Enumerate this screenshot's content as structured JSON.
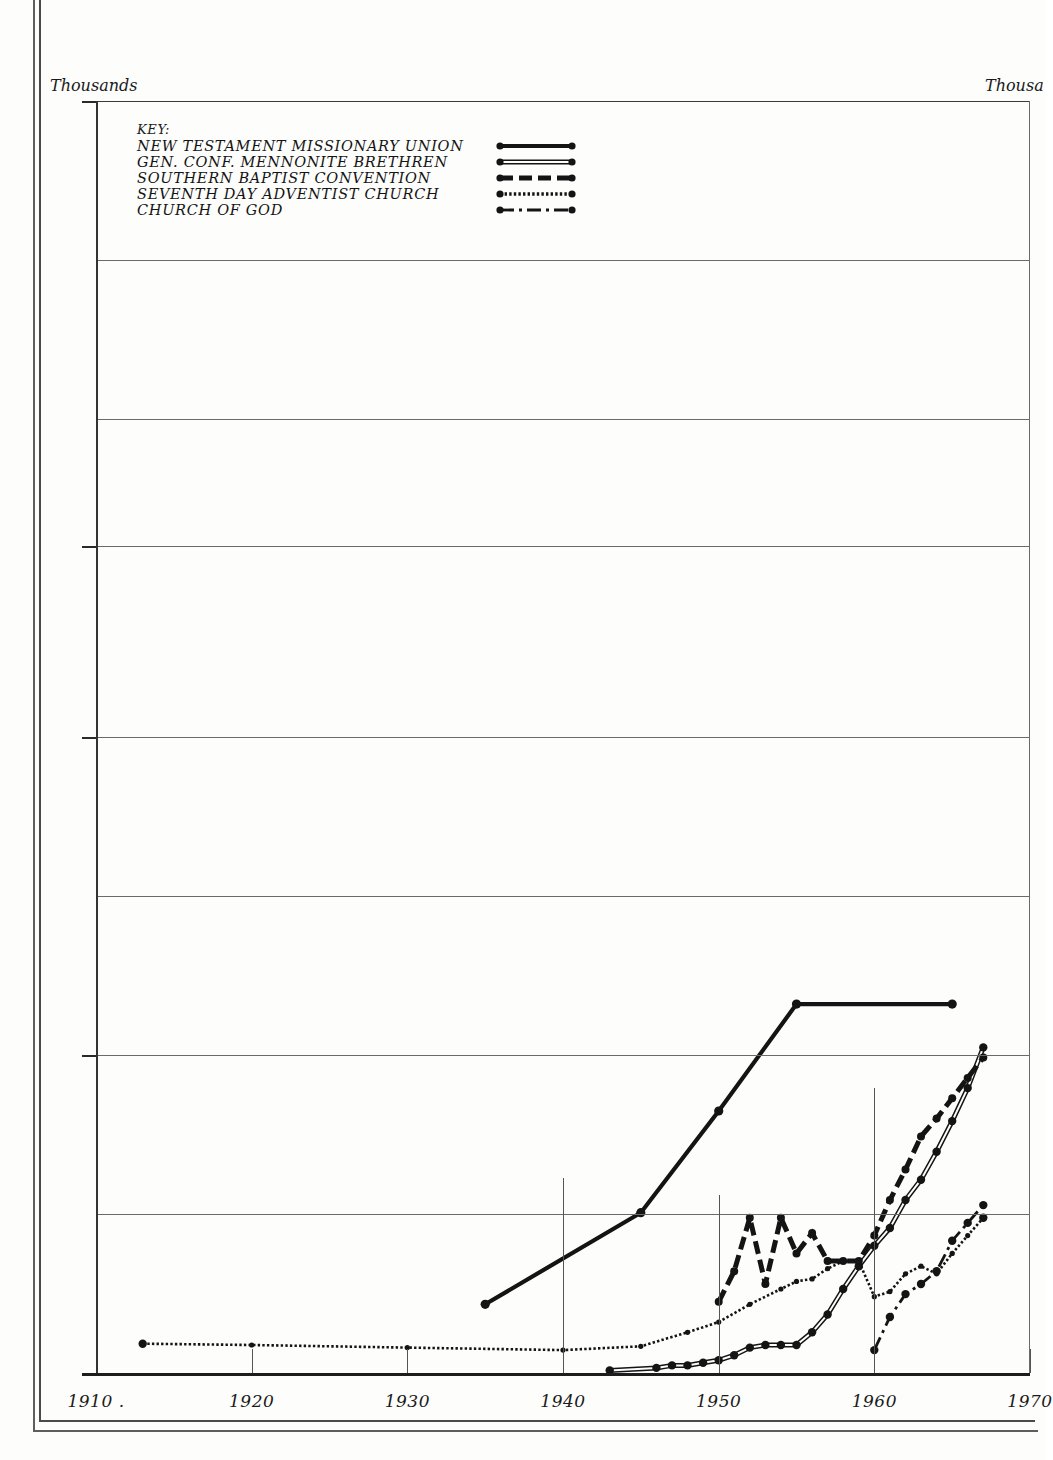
{
  "axis_captions": {
    "left": "Thousands",
    "right": "Thousa"
  },
  "legend": {
    "title": "KEY:",
    "entries": [
      {
        "label": "NEW TESTAMENT MISSIONARY UNION",
        "style": "solid-thick"
      },
      {
        "label": "GEN. CONF. MENNONITE BRETHREN",
        "style": "double-line"
      },
      {
        "label": "SOUTHERN BAPTIST CONVENTION",
        "style": "dashed-thick"
      },
      {
        "label": "SEVENTH DAY ADVENTIST  CHURCH",
        "style": "dotted-fine"
      },
      {
        "label": "CHURCH OF  GOD",
        "style": "dash-dot"
      }
    ]
  },
  "chart_data": {
    "type": "line",
    "title": "",
    "xlabel": "",
    "ylabel": "Thousands",
    "xlim": [
      1910,
      1970
    ],
    "ylim": [
      0,
      5
    ],
    "grid": true,
    "legend_position": "top-left",
    "y_ticks_labeled": [
      "5",
      "3.25",
      "2.5",
      "1.25"
    ],
    "y_tick_values": [
      5,
      3.25,
      2.5,
      1.25
    ],
    "y_gridline_values": [
      5,
      4.375,
      3.75,
      3.25,
      2.5,
      1.875,
      1.25,
      0.625
    ],
    "x_ticks": [
      "1910",
      "1920",
      "1930",
      "1940",
      "1950",
      "1960",
      "1970"
    ],
    "x_tick_values": [
      1910,
      1920,
      1930,
      1940,
      1950,
      1960,
      1970
    ],
    "series": [
      {
        "name": "NEW TESTAMENT MISSIONARY UNION",
        "style": "solid-thick",
        "color": "#141414",
        "x": [
          1935,
          1945,
          1950,
          1955,
          1965
        ],
        "values": [
          0.27,
          0.63,
          1.03,
          1.45,
          1.45
        ]
      },
      {
        "name": "GEN. CONF. MENNONITE BRETHREN",
        "style": "double-line",
        "color": "#141414",
        "x": [
          1943,
          1946,
          1947,
          1948,
          1949,
          1950,
          1951,
          1952,
          1953,
          1954,
          1955,
          1956,
          1957,
          1958,
          1959,
          1960,
          1961,
          1962,
          1963,
          1964,
          1965,
          1966,
          1967
        ],
        "values": [
          0.01,
          0.02,
          0.03,
          0.03,
          0.04,
          0.05,
          0.07,
          0.1,
          0.11,
          0.11,
          0.11,
          0.16,
          0.23,
          0.33,
          0.42,
          0.5,
          0.57,
          0.68,
          0.76,
          0.87,
          0.99,
          1.12,
          1.28
        ]
      },
      {
        "name": "SOUTHERN BAPTIST CONVENTION",
        "style": "dashed-thick",
        "color": "#141414",
        "x": [
          1950,
          1951,
          1952,
          1953,
          1954,
          1955,
          1956,
          1957,
          1958,
          1959,
          1960,
          1961,
          1962,
          1963,
          1964,
          1965,
          1966,
          1967
        ],
        "values": [
          0.28,
          0.4,
          0.61,
          0.35,
          0.61,
          0.47,
          0.55,
          0.44,
          0.44,
          0.44,
          0.54,
          0.68,
          0.8,
          0.93,
          1.0,
          1.08,
          1.16,
          1.24
        ]
      },
      {
        "name": "SEVENTH DAY ADVENTIST  CHURCH",
        "style": "dotted-fine",
        "color": "#141414",
        "x": [
          1913,
          1920,
          1930,
          1940,
          1945,
          1948,
          1950,
          1952,
          1954,
          1955,
          1956,
          1957,
          1958,
          1959,
          1960,
          1961,
          1962,
          1963,
          1964,
          1965,
          1966,
          1967
        ],
        "values": [
          0.115,
          0.11,
          0.1,
          0.09,
          0.105,
          0.16,
          0.2,
          0.27,
          0.33,
          0.36,
          0.37,
          0.41,
          0.44,
          0.44,
          0.3,
          0.32,
          0.39,
          0.42,
          0.39,
          0.47,
          0.54,
          0.61
        ],
        "note": "nearly flat from 1913 to about 1945, then rising"
      },
      {
        "name": "CHURCH OF  GOD",
        "style": "dash-dot",
        "color": "#141414",
        "x": [
          1960,
          1961,
          1962,
          1963,
          1964,
          1965,
          1966,
          1967
        ],
        "values": [
          0.09,
          0.22,
          0.31,
          0.35,
          0.4,
          0.52,
          0.59,
          0.66
        ]
      }
    ]
  }
}
